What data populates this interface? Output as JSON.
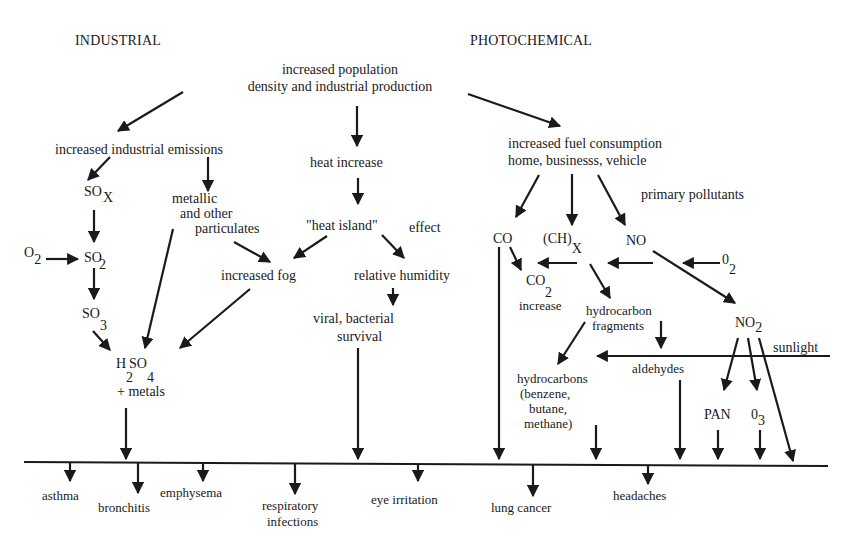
{
  "headers": {
    "industrial": "INDUSTRIAL",
    "photochemical": "PHOTOCHEMICAL"
  },
  "nodes": {
    "root_line1": "increased population",
    "root_line2": "density and industrial production",
    "industrial_emissions": "increased industrial emissions",
    "sox": "SO",
    "sox_sub": "X",
    "o2_left": "O",
    "o2_left_sub": "2",
    "so2": "SO",
    "so2_sub": "2",
    "so3": "SO",
    "so3_sub": "3",
    "metallic_line1": "metallic",
    "metallic_line2": "and other",
    "metallic_line3": "particulates",
    "increased_fog": "increased fog",
    "h2so4_h": "H",
    "h2so4_so": "SO",
    "h2so4_sub2": "2",
    "h2so4_sub4": "4",
    "h2so4_metals": "+ metals",
    "heat_increase": "heat increase",
    "heat_island": "\"heat island\"",
    "heat_island_effect": "effect",
    "relative_humidity": "relative humidity",
    "viral_line1": "viral, bacterial",
    "viral_line2": "survival",
    "fuel_line1": "increased fuel consumption",
    "fuel_line2": "home, businesss, vehicle",
    "primary_pollutants": "primary pollutants",
    "co": "CO",
    "chx": "(CH)",
    "chx_sub": "X",
    "no": "NO",
    "o2_right": "0",
    "o2_right_sub": "2",
    "co2": "CO",
    "co2_sub": "2",
    "co2_increase": "increase",
    "hc_frag_line1": "hydrocarbon",
    "hc_frag_line2": "fragments",
    "no2": "NO",
    "no2_sub": "2",
    "sunlight": "sunlight",
    "aldehydes": "aldehydes",
    "hydrocarbons_line1": "hydrocarbons",
    "hydrocarbons_line2": "(benzene,",
    "hydrocarbons_line3": "butane,",
    "hydrocarbons_line4": "methane)",
    "pan": "PAN",
    "o3": "0",
    "o3_sub": "3"
  },
  "effects": {
    "asthma": "asthma",
    "bronchitis": "bronchitis",
    "emphysema": "emphysema",
    "respiratory_line1": "respiratory",
    "respiratory_line2": "infections",
    "eye_irritation": "eye irritation",
    "lung_cancer": "lung cancer",
    "headaches": "headaches"
  },
  "colors": {
    "ink": "#1a1a1a",
    "background": "#ffffff"
  }
}
